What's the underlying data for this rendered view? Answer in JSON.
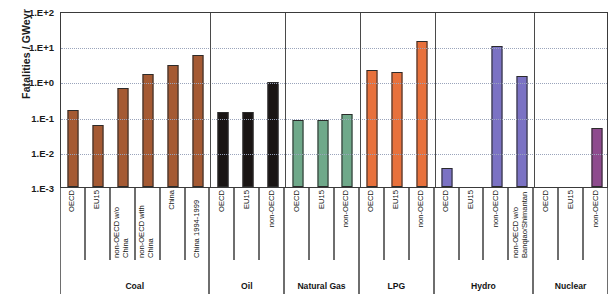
{
  "chart_data": {
    "type": "bar",
    "title": "",
    "xlabel": "",
    "ylabel": "Fatalities / GWeyr",
    "yscale": "log",
    "ylim": [
      0.001,
      100
    ],
    "ytick_labels": [
      "1.E+2",
      "1.E+1",
      "1.E+0",
      "1.E-1",
      "1.E-2",
      "1.E-3"
    ],
    "ytick_values": [
      100,
      10,
      1,
      0.1,
      0.01,
      0.001
    ],
    "grid": true,
    "legend": "none",
    "groups": [
      {
        "name": "Coal",
        "color": "#A55A33",
        "categories": [
          "OECD",
          "EU15",
          "non-OECD w/o China",
          "non-OECD with China",
          "China",
          "China 1994-1999"
        ],
        "values": [
          0.157,
          0.058,
          0.66,
          1.6,
          2.9,
          5.8
        ]
      },
      {
        "name": "Oil",
        "color": "#1A1514",
        "categories": [
          "OECD",
          "EU15",
          "non-OECD"
        ],
        "values": [
          0.135,
          0.132,
          0.98
        ]
      },
      {
        "name": "Natural Gas",
        "color": "#6FA98A",
        "categories": [
          "OECD",
          "EU15",
          "non-OECD"
        ],
        "values": [
          0.082,
          0.078,
          0.115
        ]
      },
      {
        "name": "LPG",
        "color": "#E8713C",
        "categories": [
          "OECD",
          "EU15",
          "non-OECD"
        ],
        "values": [
          2.05,
          1.8,
          14.0
        ]
      },
      {
        "name": "Hydro",
        "color": "#7B72C4",
        "categories": [
          "OECD",
          "EU15",
          "non-OECD",
          "non-OECD w/o Banqiao/Shimantan"
        ],
        "values": [
          0.0035,
          null,
          10.0,
          1.45
        ]
      },
      {
        "name": "Nuclear",
        "color": "#8E4B8E",
        "categories": [
          "OECD",
          "EU15",
          "non-OECD"
        ],
        "values": [
          null,
          null,
          0.048
        ]
      }
    ]
  }
}
